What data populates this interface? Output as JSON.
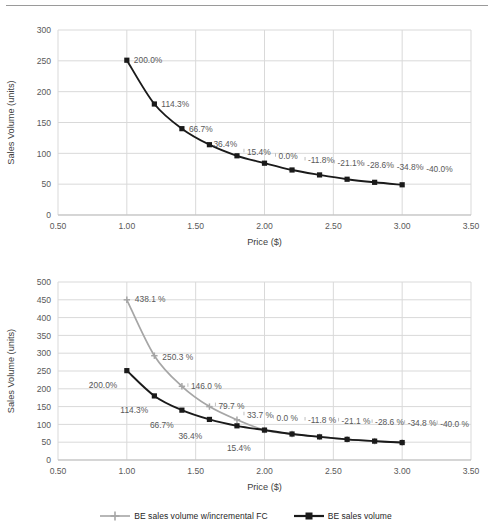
{
  "page": {
    "background": "#ffffff",
    "top_rule_color": "#9a9a9a"
  },
  "colors": {
    "series_black": "#1a1a1a",
    "series_gray": "#a6a6a6",
    "grid": "#d9d9d9",
    "axis_text": "#595959",
    "label_text": "#595959",
    "legend_text": "#262626"
  },
  "legend": {
    "position": "bottom-center",
    "entries": [
      {
        "label": "BE sales volume w/incremental FC",
        "color": "#a6a6a6",
        "marker": "cross"
      },
      {
        "label": "BE sales volume",
        "color": "#1a1a1a",
        "marker": "square"
      }
    ]
  },
  "chart_data": [
    {
      "id": "top",
      "type": "line",
      "title": "",
      "xlabel": "Price ($)",
      "ylabel": "Sales Volume (units)",
      "xlim": [
        0.5,
        3.5
      ],
      "ylim": [
        0,
        300
      ],
      "xticks": [
        "0.50",
        "1.00",
        "1.50",
        "2.00",
        "2.50",
        "3.00",
        "3.50"
      ],
      "xtick_values": [
        0.5,
        1.0,
        1.5,
        2.0,
        2.5,
        3.0,
        3.5
      ],
      "yticks": [
        "0",
        "50",
        "100",
        "150",
        "200",
        "250",
        "300"
      ],
      "ytick_values": [
        0,
        50,
        100,
        150,
        200,
        250,
        300
      ],
      "grid": "horizontal-and-vertical",
      "x": [
        1.0,
        1.2,
        1.4,
        1.6,
        1.8,
        2.0,
        2.2,
        2.4,
        2.6,
        2.8,
        3.0
      ],
      "series": [
        {
          "name": "BE sales volume",
          "color": "#1a1a1a",
          "marker": "square",
          "values": [
            251,
            180,
            140,
            114,
            96,
            84,
            73,
            65,
            58,
            53,
            49
          ],
          "point_labels": [
            "200.0%",
            "114.3%",
            "66.7%",
            "36.4%",
            "15.4%",
            "0.0%",
            "-11.8%",
            "-21.1%",
            "-28.6%",
            "-34.8%",
            "-40.0%"
          ]
        }
      ]
    },
    {
      "id": "bottom",
      "type": "line",
      "title": "",
      "xlabel": "Price ($)",
      "ylabel": "Sales Volume (units)",
      "xlim": [
        0.5,
        3.5
      ],
      "ylim": [
        0,
        500
      ],
      "xticks": [
        "0.50",
        "1.00",
        "1.50",
        "2.00",
        "2.50",
        "3.00",
        "3.50"
      ],
      "xtick_values": [
        0.5,
        1.0,
        1.5,
        2.0,
        2.5,
        3.0,
        3.5
      ],
      "yticks": [
        "0",
        "50",
        "100",
        "150",
        "200",
        "250",
        "300",
        "350",
        "400",
        "450",
        "500"
      ],
      "ytick_values": [
        0,
        50,
        100,
        150,
        200,
        250,
        300,
        350,
        400,
        450,
        500
      ],
      "grid": "horizontal-and-vertical",
      "x": [
        1.0,
        1.2,
        1.4,
        1.6,
        1.8,
        2.0,
        2.2,
        2.4,
        2.6,
        2.8,
        3.0
      ],
      "series": [
        {
          "name": "BE sales volume w/incremental FC",
          "color": "#a6a6a6",
          "marker": "cross",
          "values": [
            450,
            293,
            207,
            150,
            113,
            84,
            73,
            65,
            58,
            53,
            49
          ],
          "point_labels": [
            "438.1 %",
            "250.3 %",
            "146.0 %",
            "79.7 %",
            "33.7 %",
            "0.0 %",
            "-11.8 %",
            "-21.1 %",
            "-28.6 %",
            "-34.8 %",
            "-40.0 %"
          ]
        },
        {
          "name": "BE sales volume",
          "color": "#1a1a1a",
          "marker": "square",
          "values": [
            251,
            180,
            140,
            114,
            96,
            84,
            73,
            65,
            58,
            53,
            49
          ],
          "point_labels": [
            "200.0%",
            "114.3%",
            "66.7%",
            "36.4%",
            "15.4%",
            "",
            "",
            "",
            "",
            "",
            ""
          ]
        }
      ]
    }
  ]
}
